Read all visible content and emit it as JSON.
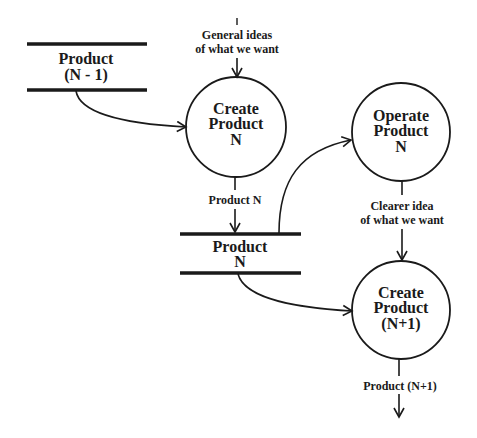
{
  "diagram": {
    "type": "data-flow",
    "processes": [
      {
        "id": "create_n",
        "lines": [
          "Create",
          "Product",
          "N"
        ]
      },
      {
        "id": "operate_n",
        "lines": [
          "Operate",
          "Product",
          "N"
        ]
      },
      {
        "id": "create_n1",
        "lines": [
          "Create",
          "Product",
          "(N+1)"
        ]
      }
    ],
    "stores": [
      {
        "id": "product_n_minus_1",
        "lines": [
          "Product",
          "(N - 1)"
        ]
      },
      {
        "id": "product_n",
        "lines": [
          "Product",
          "N"
        ]
      }
    ],
    "flows": [
      {
        "id": "general_ideas",
        "lines": [
          "General ideas",
          "of what we want"
        ],
        "to": "create_n"
      },
      {
        "id": "prev_to_create",
        "from": "product_n_minus_1",
        "to": "create_n"
      },
      {
        "id": "product_n_flow",
        "label": "Product N",
        "from": "create_n",
        "to": "product_n"
      },
      {
        "id": "store_to_operate",
        "from": "product_n",
        "to": "operate_n"
      },
      {
        "id": "clearer_idea",
        "lines": [
          "Clearer idea",
          "of what we want"
        ],
        "from": "operate_n",
        "to": "create_n1"
      },
      {
        "id": "store_to_create_n1",
        "from": "product_n",
        "to": "create_n1"
      },
      {
        "id": "product_n1_flow",
        "label": "Product (N+1)",
        "from": "create_n1"
      }
    ]
  }
}
